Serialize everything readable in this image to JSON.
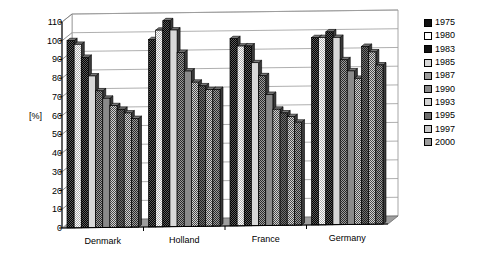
{
  "chart_data": {
    "type": "bar",
    "title": "",
    "subtitle": "",
    "xlabel": "",
    "ylabel": "[%]",
    "ylim": [
      0,
      110
    ],
    "ytick_step": 10,
    "yticks": [
      0,
      10,
      20,
      30,
      40,
      50,
      60,
      70,
      80,
      90,
      100,
      110
    ],
    "grid": true,
    "grid_axis": "y",
    "legend_position": "right",
    "categories": [
      "Denmark",
      "Holland",
      "France",
      "Germany"
    ],
    "series": [
      {
        "name": "1975",
        "values": [
          100,
          100,
          100,
          100
        ]
      },
      {
        "name": "1980",
        "values": [
          98,
          105,
          96,
          100
        ]
      },
      {
        "name": "1983",
        "values": [
          91,
          110,
          96,
          103
        ]
      },
      {
        "name": "1985",
        "values": [
          81,
          105,
          87,
          100
        ]
      },
      {
        "name": "1987",
        "values": [
          73,
          93,
          80,
          88
        ]
      },
      {
        "name": "1990",
        "values": [
          69,
          83,
          70,
          82
        ]
      },
      {
        "name": "1993",
        "values": [
          65,
          77,
          62,
          78
        ]
      },
      {
        "name": "1995",
        "values": [
          63,
          75,
          60,
          95
        ]
      },
      {
        "name": "1997",
        "values": [
          61,
          73,
          58,
          92
        ]
      },
      {
        "name": "2000",
        "values": [
          58,
          73,
          55,
          85
        ]
      }
    ],
    "series_fills": [
      "solid-black",
      "white",
      "solid-black",
      "light-gray",
      "mid-gray-dither",
      "mid-gray",
      "light-dither",
      "mid-dither",
      "light-gray-dither",
      "mid-gray-dither"
    ]
  },
  "legend": {
    "items": [
      {
        "label": "1975"
      },
      {
        "label": "1980"
      },
      {
        "label": "1983"
      },
      {
        "label": "1985"
      },
      {
        "label": "1987"
      },
      {
        "label": "1990"
      },
      {
        "label": "1993"
      },
      {
        "label": "1995"
      },
      {
        "label": "1997"
      },
      {
        "label": "2000"
      }
    ]
  },
  "colors": {
    "axis": "#000000",
    "grid": "#9a9a9a",
    "plot_background": "#ffffff",
    "bar_outline": "#000000",
    "text": "#000000"
  }
}
